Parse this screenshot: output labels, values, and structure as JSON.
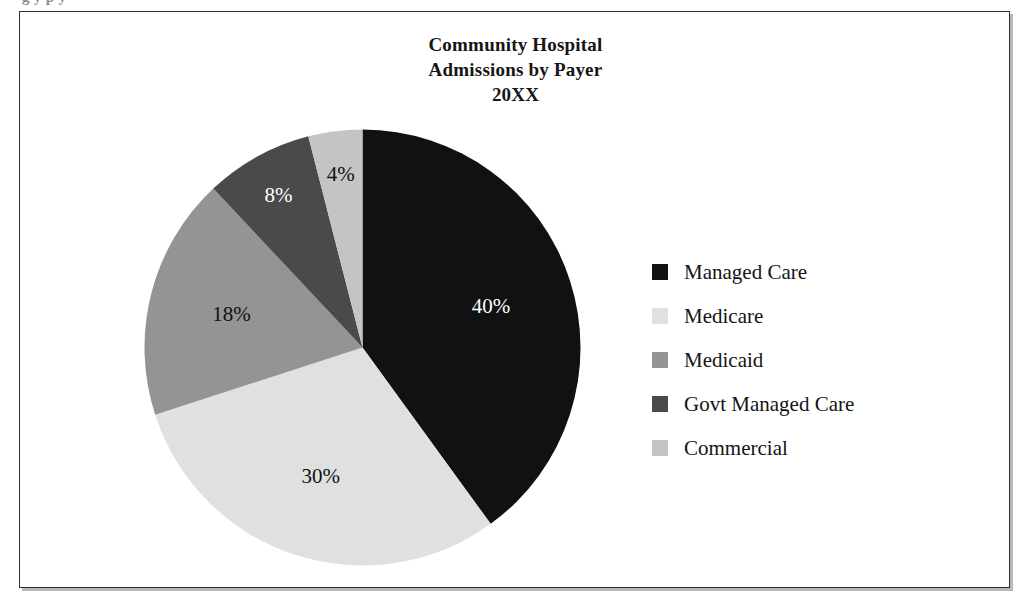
{
  "caption_remnant": "g                                                                  y p y",
  "figure": {
    "title_lines": [
      "Community Hospital",
      "Admissions by Payer",
      "20XX"
    ],
    "border_color": "#2f2f2f",
    "background": "#ffffff"
  },
  "chart_data": {
    "type": "pie",
    "title": "Community Hospital Admissions by Payer 20XX",
    "categories": [
      "Managed Care",
      "Medicare",
      "Medicaid",
      "Govt Managed Care",
      "Commercial"
    ],
    "values": [
      40,
      30,
      18,
      8,
      4
    ],
    "value_labels": [
      "40%",
      "30%",
      "18%",
      "8%",
      "4%"
    ],
    "units": "percent",
    "start_angle_deg": 0,
    "direction": "clockwise",
    "colors": [
      "#111111",
      "#e0e0e0",
      "#949494",
      "#4a4a4a",
      "#c4c4c4"
    ],
    "label_colors": [
      "#ffffff",
      "#111111",
      "#111111",
      "#ffffff",
      "#111111"
    ],
    "legend_position": "right",
    "grid": false,
    "xlabel": "",
    "ylabel": ""
  },
  "legend": {
    "items": [
      {
        "label": "Managed Care",
        "color": "#111111"
      },
      {
        "label": "Medicare",
        "color": "#e0e0e0"
      },
      {
        "label": "Medicaid",
        "color": "#949494"
      },
      {
        "label": "Govt Managed Care",
        "color": "#4a4a4a"
      },
      {
        "label": "Commercial",
        "color": "#c4c4c4"
      }
    ]
  }
}
